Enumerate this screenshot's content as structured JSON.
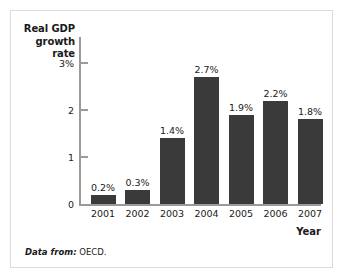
{
  "figure": {
    "source_label": "Data from:",
    "source_value": "OECD."
  },
  "chart_data": {
    "type": "bar",
    "title": "",
    "xlabel": "Year",
    "ylabel": "Real GDP growth rate",
    "categories": [
      "2001",
      "2002",
      "2003",
      "2004",
      "2005",
      "2006",
      "2007"
    ],
    "values": [
      0.2,
      0.3,
      1.4,
      2.7,
      1.9,
      2.2,
      1.8
    ],
    "data_labels": [
      "0.2%",
      "0.3%",
      "1.4%",
      "2.7%",
      "1.9%",
      "2.2%",
      "1.8%"
    ],
    "ylim": [
      0,
      3
    ],
    "ytick_values": [
      0,
      1,
      2,
      3
    ],
    "ytick_labels": [
      "0",
      "1",
      "2",
      "3%"
    ],
    "grid": false,
    "legend": null,
    "bar_color": "#3a3a3a",
    "axis_color": "#9a9a9a"
  }
}
